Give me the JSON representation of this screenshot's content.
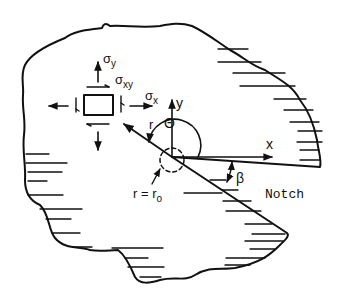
{
  "figure": {
    "type": "notch stress field diagram",
    "labels": {
      "sigma_y": "σ",
      "sigma_y_sub": "y",
      "sigma_xy": "σ",
      "sigma_xy_sub": "xy",
      "sigma_x": "σ",
      "sigma_x_sub": "x",
      "r": "r",
      "theta": "Θ",
      "y_axis": "y",
      "x_axis": "x",
      "beta": "β",
      "r_eq_r0": "r = r",
      "r0_sub": "o",
      "notch": "Notch"
    },
    "colors": {
      "ink": "#111111",
      "background": "#ffffff"
    }
  }
}
